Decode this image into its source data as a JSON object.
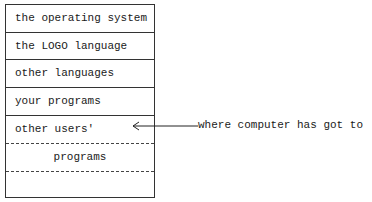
{
  "diagram": {
    "type": "memory-layout",
    "rows": [
      {
        "label": "the operating system",
        "border": "solid"
      },
      {
        "label": "the LOGO language",
        "border": "solid"
      },
      {
        "label": "other languages",
        "border": "solid"
      },
      {
        "label": "your programs",
        "border": "solid"
      },
      {
        "label": "other users'",
        "border": "dashed"
      },
      {
        "label": "programs",
        "border": "dashed"
      },
      {
        "label": "",
        "border": "none"
      }
    ],
    "annotation": {
      "text": "where computer has got to",
      "points_to_row": 3
    }
  }
}
